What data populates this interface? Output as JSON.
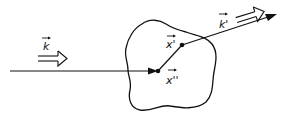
{
  "diagram": {
    "type": "scattering-geometry",
    "labels": {
      "incident_wavevector": "k",
      "scattered_wavevector": "k'",
      "entry_point": "x''",
      "exit_point": "x'"
    },
    "colors": {
      "stroke": "#111111",
      "background": "#ffffff"
    },
    "elements": [
      {
        "id": "incident-ray",
        "desc": "horizontal line entering region, arrow pointing right to x''"
      },
      {
        "id": "internal-path",
        "desc": "segment from x'' to x' inside region"
      },
      {
        "id": "scattered-ray",
        "desc": "line from x' exiting region, arrow pointing up-right"
      },
      {
        "id": "scatterer-region",
        "desc": "irregular closed blob"
      },
      {
        "id": "incident-direction-arrow",
        "desc": "double-line open arrow labelled k"
      },
      {
        "id": "scattered-direction-arrow",
        "desc": "double-line open arrow labelled k'"
      }
    ]
  }
}
